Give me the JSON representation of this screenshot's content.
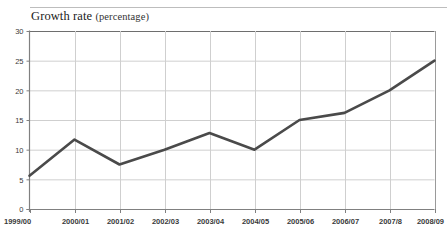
{
  "header": {
    "title": "Growth rate",
    "unit": "(percentage)"
  },
  "chart_data": {
    "type": "line",
    "title": "Growth rate (percentage)",
    "subtitle": "",
    "xlabel": "",
    "ylabel": "",
    "unit": "percentage",
    "categories": [
      "1999/00",
      "2000/01",
      "2001/02",
      "2002/03",
      "2003/04",
      "2004/05",
      "2005/06",
      "2006/07",
      "2007/8",
      "2008/09"
    ],
    "values": [
      5.6,
      11.7,
      7.5,
      10.0,
      12.8,
      10.0,
      15.0,
      16.2,
      20.0,
      25.0
    ],
    "series": [
      {
        "name": "Growth rate",
        "values": [
          5.6,
          11.7,
          7.5,
          10.0,
          12.8,
          10.0,
          15.0,
          16.2,
          20.0,
          25.0
        ]
      }
    ],
    "ylim": [
      0,
      30
    ],
    "yticks": [
      0,
      5,
      10,
      15,
      20,
      25,
      30
    ],
    "ytick_labels": [
      "0",
      "5",
      "10",
      "15",
      "20",
      "25",
      "30"
    ],
    "xtick_labels": [
      "1999/00",
      "2000/01",
      "2001/02",
      "2002/03",
      "2003/04",
      "2004/05",
      "2005/06",
      "2006/07",
      "2007/8",
      "2008/09"
    ],
    "grid": true,
    "grid_axis": "both",
    "legend": false,
    "legend_position": "none",
    "line_color": "#4a4a4a",
    "grid_color": "#cfcfcf",
    "axis_color": "#808080",
    "background_color": "#ffffff"
  }
}
